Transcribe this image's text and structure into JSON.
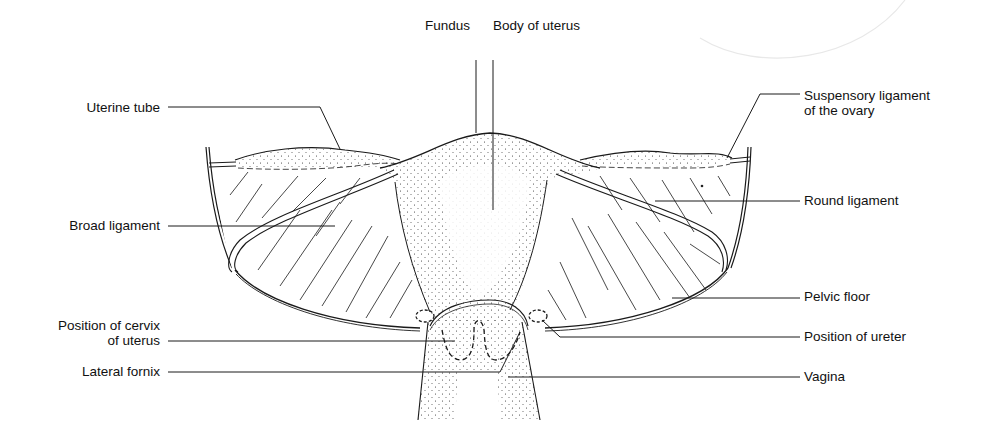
{
  "diagram": {
    "labels": {
      "fundus": "Fundus",
      "body_of_uterus": "Body of uterus",
      "uterine_tube": "Uterine tube",
      "broad_ligament": "Broad ligament",
      "position_of_cervix_line1": "Position of cervix",
      "position_of_cervix_line2": "of uterus",
      "lateral_fornix": "Lateral fornix",
      "suspensory_ligament_line1": "Suspensory ligament",
      "suspensory_ligament_line2": "of the ovary",
      "round_ligament": "Round ligament",
      "pelvic_floor": "Pelvic floor",
      "position_of_ureter": "Position of ureter",
      "vagina": "Vagina"
    },
    "colors": {
      "ink": "#1a1a1a",
      "background": "#ffffff",
      "faint_arc": "#e8e8e8"
    }
  }
}
